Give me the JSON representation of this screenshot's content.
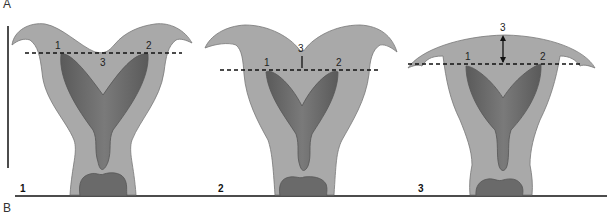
{
  "figure": {
    "top_label": "A",
    "bottom_label": "B",
    "colors": {
      "outer_tissue": "#a9a9a9",
      "inner_cavity": "#6e6e6e",
      "outline": "#555555",
      "lines": "#111111",
      "background": "#ffffff"
    }
  },
  "panels": [
    {
      "number": "1",
      "point_labels": [
        "1",
        "2",
        "3"
      ],
      "description": "Fundal indentation below interostial line"
    },
    {
      "number": "2",
      "point_labels": [
        "1",
        "2",
        "3"
      ],
      "description": "Fundal indentation above interostial line"
    },
    {
      "number": "3",
      "point_labels": [
        "1",
        "2",
        "3"
      ],
      "description": "Convex fundus with distance above interostial line"
    }
  ]
}
